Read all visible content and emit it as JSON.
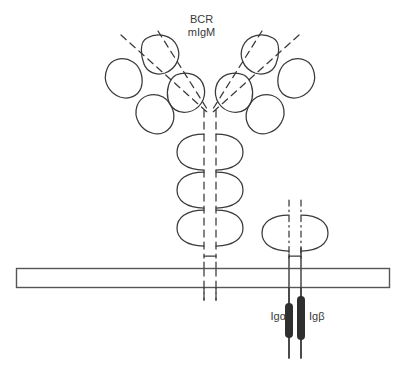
{
  "figure": {
    "title_lines": [
      "BCR",
      "mIgM"
    ],
    "type": "cell-surface receptor schematic",
    "background_color": "#ffffff",
    "stroke_color": "#3a3a3a",
    "fill_color": "#2f2f2f"
  },
  "labels": {
    "bcr": "BCR",
    "migm": "mIgM",
    "ig_alpha": "Igα",
    "ig_beta": "Igβ"
  },
  "membrane": {
    "name": "plasma-membrane",
    "x": 16,
    "y": 268,
    "width": 374,
    "height": 20,
    "stroke": "#55565a",
    "fill": "#ffffff",
    "stroke_width": 1.4
  },
  "bcr_receptor": {
    "name": "membrane-igm",
    "center_x": 210,
    "fork_y": 112,
    "arms": [
      {
        "name": "left-fab-arm",
        "direction": "up-left",
        "domain_count": 4
      },
      {
        "name": "right-fab-arm",
        "direction": "up-right",
        "domain_count": 4
      }
    ],
    "stem_domain_pairs": 3,
    "stem_domain_y": [
      152,
      190,
      228
    ],
    "stem_line_style": "dashed",
    "stem_left_x": 203,
    "stem_right_x": 217,
    "transmembrane_bottom_y": 300
  },
  "ig_alpha_beta": {
    "name": "ig-alpha-ig-beta-heterodimer",
    "center_x": 296,
    "domain_pair_y": 233,
    "line_style": "dash-dot",
    "chains": [
      {
        "name": "ig-alpha-chain",
        "label": "Igα",
        "x": 289,
        "itam_top": 303,
        "itam_bottom": 338,
        "tail_bottom": 358
      },
      {
        "name": "ig-beta-chain",
        "label": "Igβ",
        "x": 301,
        "itam_top": 296,
        "itam_bottom": 340,
        "tail_bottom": 358
      }
    ],
    "itam_description": "cytoplasmic ITAM motifs drawn as filled dark bars"
  }
}
